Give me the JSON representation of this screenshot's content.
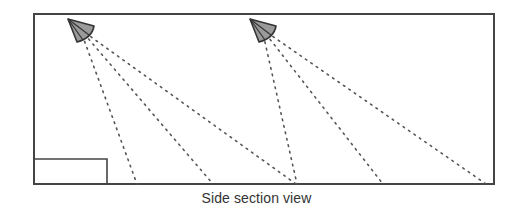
{
  "diagram": {
    "caption": "Side section view",
    "colors": {
      "frame": "#444444",
      "beam": "#555555",
      "speaker_fill": "#9a9a9a",
      "speaker_stroke": "#333333",
      "caption": "#333333"
    },
    "room": {
      "x": 34,
      "y": 14,
      "width": 460,
      "height": 170
    },
    "furniture_box": {
      "x": 34,
      "y": 159,
      "width": 73,
      "height": 25
    },
    "speakers": [
      {
        "id": "speaker-1",
        "apex": [
          68,
          19
        ],
        "beam_targets": [
          [
            137,
            184
          ],
          [
            213,
            184
          ],
          [
            296,
            184
          ]
        ]
      },
      {
        "id": "speaker-2",
        "apex": [
          250,
          19
        ],
        "beam_targets": [
          [
            297,
            184
          ],
          [
            383,
            184
          ],
          [
            486,
            184
          ]
        ]
      }
    ]
  }
}
